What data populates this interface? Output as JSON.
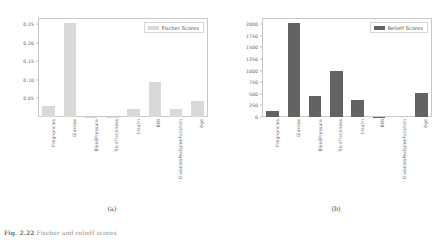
{
  "figure": {
    "caption_label": "Fig. 2.22",
    "caption_text": "Fischer and relieff scores",
    "background": "#ffffff"
  },
  "panels": [
    {
      "id": "a",
      "caption": "(a)",
      "legend_label": "Fischer Scores",
      "bar_color": "#d9d9d9",
      "chart_data": {
        "type": "bar",
        "title": "",
        "xlabel": "",
        "ylabel": "",
        "categories": [
          "Pregnancies",
          "Glucose",
          "BloodPressure",
          "SkinThickness",
          "Insulin",
          "BMI",
          "DiabetesPedigreeFunction",
          "Age"
        ],
        "values": [
          0.031,
          0.254,
          0.001,
          0.001,
          0.022,
          0.093,
          0.022,
          0.044
        ],
        "series": [
          {
            "name": "Fischer Scores",
            "values": [
              0.031,
              0.254,
              0.001,
              0.001,
              0.022,
              0.093,
              0.022,
              0.044
            ]
          }
        ],
        "ylim": [
          0.0,
          0.2667
        ],
        "yticks": [
          0.05,
          0.1,
          0.15,
          0.2,
          0.25
        ],
        "ytick_labels": [
          "0.05",
          "0.10",
          "0.15",
          "0.20",
          "0.25"
        ],
        "grid": false,
        "legend_position": "upper right"
      }
    },
    {
      "id": "b",
      "caption": "(b)",
      "legend_label": "Relieff Scores",
      "bar_color": "#636363",
      "chart_data": {
        "type": "bar",
        "title": "",
        "xlabel": "",
        "ylabel": "",
        "categories": [
          "Pregnancies",
          "Glucose",
          "BloodPressure",
          "SkinThickness",
          "Insulin",
          "BMI",
          "DiabetesPedigreeFunction",
          "Age"
        ],
        "values": [
          130,
          2020,
          460,
          995,
          370,
          8,
          0,
          520
        ],
        "series": [
          {
            "name": "Relieff Scores",
            "values": [
              130,
              2020,
              460,
              995,
              370,
              8,
              0,
              520
            ]
          }
        ],
        "ylim": [
          0,
          2130
        ],
        "yticks": [
          0,
          250,
          500,
          750,
          1000,
          1250,
          1500,
          1750,
          2000
        ],
        "ytick_labels": [
          "0",
          "250",
          "500",
          "750",
          "1000",
          "1250",
          "1500",
          "1750",
          "2000"
        ],
        "grid": false,
        "legend_position": "upper right"
      }
    }
  ]
}
